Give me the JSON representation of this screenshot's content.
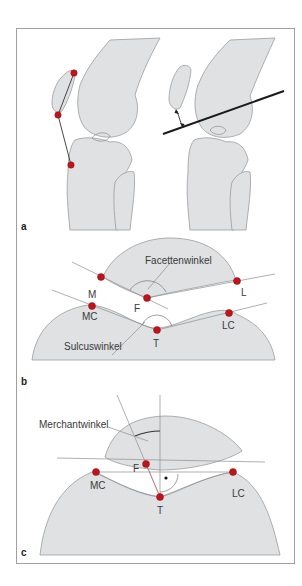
{
  "figure": {
    "panels": [
      {
        "id": "a",
        "label": "a"
      },
      {
        "id": "b",
        "label": "b"
      },
      {
        "id": "c",
        "label": "c"
      }
    ],
    "panel_b": {
      "angle_labels": {
        "facet": "Facettenwinkel",
        "sulcus": "Sulcuswinkel"
      },
      "points": {
        "M": "M",
        "L": "L",
        "F": "F",
        "MC": "MC",
        "LC": "LC",
        "T": "T"
      }
    },
    "panel_c": {
      "angle_labels": {
        "merchant": "Merchantwinkel"
      },
      "points": {
        "F": "F",
        "MC": "MC",
        "LC": "LC",
        "T": "T"
      }
    },
    "colors": {
      "bone_fill": "#dfe1e2",
      "landmark": "#c0141a",
      "frame": "#a0a0a0"
    }
  }
}
